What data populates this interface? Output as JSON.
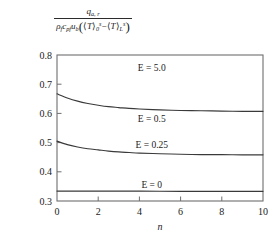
{
  "axis_title": {
    "numerator": {
      "symbol": "q",
      "subscript": "a, r"
    },
    "denominator": {
      "rho": "ρ",
      "rho_sub": "f",
      "c": "c",
      "c_sub": "pf",
      "u": "u",
      "u_sub": "b",
      "open_paren": "(",
      "term1_open": "⟨",
      "term1_symbol": "T",
      "term1_close": "⟩",
      "term1_sub": "0",
      "term1_sup": "s",
      "minus": "−",
      "term2_open": "⟨",
      "term2_symbol": "T",
      "term2_close": "⟩",
      "term2_sub": "L",
      "term2_sup": "s",
      "close_paren": ")"
    }
  },
  "chart_data": {
    "type": "line",
    "title": "",
    "xlabel": "n",
    "ylabel": "q_{a,r} / (rho_f c_pf u_b (<T>_0^s - <T>_L^s))",
    "xlim": [
      0,
      10
    ],
    "ylim": [
      0.3,
      0.8
    ],
    "xticks": [
      0,
      2,
      4,
      6,
      8,
      10
    ],
    "xticklabels": [
      "0",
      "2",
      "4",
      "6",
      "8",
      "10"
    ],
    "yticks": [
      0.3,
      0.4,
      0.5,
      0.6,
      0.7,
      0.8
    ],
    "yticklabels": [
      "0.3",
      "0.4",
      "0.5",
      "0.6",
      "0.7",
      "0.8"
    ],
    "grid": false,
    "legend": "inline-annotations",
    "line_color": "#3a3a3a",
    "frame_color": "#6e6e6e",
    "series": [
      {
        "name": "E = 5.0",
        "E": 5.0,
        "label": "E = 5.0",
        "label_x": 4.6,
        "label_y": 0.757,
        "x": [
          0,
          0.5,
          1,
          1.5,
          2,
          2.5,
          3,
          4,
          5,
          6,
          7,
          8,
          9,
          10
        ],
        "values": [
          0.8,
          0.8,
          0.8,
          0.8,
          0.8,
          0.8,
          0.8,
          0.8,
          0.8,
          0.8,
          0.8,
          0.8,
          0.8,
          0.8
        ],
        "note": "coincides with upper frame at 0.8"
      },
      {
        "name": "E = 0.5",
        "E": 0.5,
        "label": "E = 0.5",
        "label_x": 4.6,
        "label_y": 0.583,
        "x": [
          0,
          0.5,
          1,
          1.5,
          2,
          2.5,
          3,
          3.5,
          4,
          5,
          6,
          7,
          8,
          9,
          10
        ],
        "values": [
          0.667,
          0.653,
          0.642,
          0.634,
          0.628,
          0.623,
          0.62,
          0.617,
          0.615,
          0.612,
          0.61,
          0.609,
          0.608,
          0.607,
          0.607
        ]
      },
      {
        "name": "E = 0.25",
        "E": 0.25,
        "label": "E = 0.25",
        "label_x": 4.6,
        "label_y": 0.492,
        "x": [
          0,
          0.5,
          1,
          1.5,
          2,
          2.5,
          3,
          3.5,
          4,
          5,
          6,
          7,
          8,
          9,
          10
        ],
        "values": [
          0.505,
          0.493,
          0.485,
          0.479,
          0.475,
          0.471,
          0.468,
          0.466,
          0.464,
          0.462,
          0.46,
          0.459,
          0.459,
          0.458,
          0.458
        ]
      },
      {
        "name": "E = 0",
        "E": 0,
        "label": "E = 0",
        "label_x": 4.6,
        "label_y": 0.357,
        "x": [
          0,
          2,
          4,
          6,
          8,
          10
        ],
        "values": [
          0.334,
          0.334,
          0.334,
          0.333,
          0.333,
          0.333
        ]
      }
    ]
  }
}
